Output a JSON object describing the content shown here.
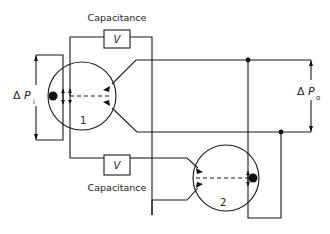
{
  "diagram": {
    "capacitor_top": {
      "label": "Capacitance",
      "symbol": "V"
    },
    "capacitor_bottom": {
      "label": "Capacitance",
      "symbol": "V"
    },
    "input_pressure": {
      "delta": "Δ",
      "var": "P",
      "sub": "i"
    },
    "output_pressure": {
      "delta": "Δ",
      "var": "P",
      "sub": "o"
    },
    "element_1": {
      "number": "1"
    },
    "element_2": {
      "number": "2"
    }
  }
}
